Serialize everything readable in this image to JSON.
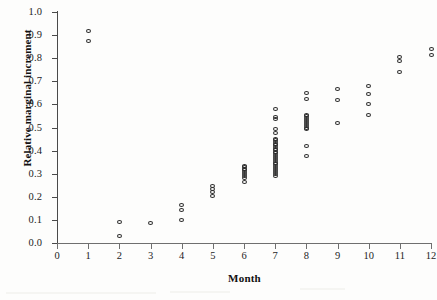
{
  "chart_data": {
    "type": "scatter",
    "title": "",
    "xlabel": "Month",
    "ylabel": "Relative marginal increment",
    "xlim": [
      0,
      12
    ],
    "ylim": [
      0.0,
      1.0
    ],
    "grid": false,
    "legend": "none",
    "marker": "open-circle",
    "xticks": [
      "0",
      "1",
      "2",
      "3",
      "4",
      "5",
      "6",
      "7",
      "8",
      "9",
      "10",
      "11",
      "12"
    ],
    "xtick_values": [
      0,
      1,
      2,
      3,
      4,
      5,
      6,
      7,
      8,
      9,
      10,
      11,
      12
    ],
    "yticks": [
      "0.0",
      "0.1",
      "0.2",
      "0.3",
      "0.4",
      "0.5",
      "0.6",
      "0.7",
      "0.8",
      "0.9",
      "1.0"
    ],
    "ytick_values": [
      0.0,
      0.1,
      0.2,
      0.3,
      0.4,
      0.5,
      0.6,
      0.7,
      0.8,
      0.9,
      1.0
    ],
    "point_color": "#2a2a2a",
    "axis_color": "#4a4a4a",
    "background": "#fdfdfc",
    "series": [
      {
        "name": "Relative marginal increment by month",
        "points": [
          {
            "x": 1,
            "y": 0.918
          },
          {
            "x": 1,
            "y": 0.873
          },
          {
            "x": 2,
            "y": 0.09
          },
          {
            "x": 2,
            "y": 0.032
          },
          {
            "x": 3,
            "y": 0.088
          },
          {
            "x": 4,
            "y": 0.163
          },
          {
            "x": 4,
            "y": 0.143
          },
          {
            "x": 4,
            "y": 0.101
          },
          {
            "x": 5,
            "y": 0.245
          },
          {
            "x": 5,
            "y": 0.233
          },
          {
            "x": 5,
            "y": 0.221
          },
          {
            "x": 5,
            "y": 0.203
          },
          {
            "x": 6,
            "y": 0.335
          },
          {
            "x": 6,
            "y": 0.328
          },
          {
            "x": 6,
            "y": 0.322
          },
          {
            "x": 6,
            "y": 0.315
          },
          {
            "x": 6,
            "y": 0.308
          },
          {
            "x": 6,
            "y": 0.3
          },
          {
            "x": 6,
            "y": 0.29
          },
          {
            "x": 6,
            "y": 0.28
          },
          {
            "x": 6,
            "y": 0.262
          },
          {
            "x": 7,
            "y": 0.58
          },
          {
            "x": 7,
            "y": 0.546
          },
          {
            "x": 7,
            "y": 0.538
          },
          {
            "x": 7,
            "y": 0.492
          },
          {
            "x": 7,
            "y": 0.476
          },
          {
            "x": 7,
            "y": 0.452
          },
          {
            "x": 7,
            "y": 0.445
          },
          {
            "x": 7,
            "y": 0.438
          },
          {
            "x": 7,
            "y": 0.43
          },
          {
            "x": 7,
            "y": 0.423
          },
          {
            "x": 7,
            "y": 0.416
          },
          {
            "x": 7,
            "y": 0.409
          },
          {
            "x": 7,
            "y": 0.402
          },
          {
            "x": 7,
            "y": 0.395
          },
          {
            "x": 7,
            "y": 0.388
          },
          {
            "x": 7,
            "y": 0.38
          },
          {
            "x": 7,
            "y": 0.372
          },
          {
            "x": 7,
            "y": 0.364
          },
          {
            "x": 7,
            "y": 0.356
          },
          {
            "x": 7,
            "y": 0.348
          },
          {
            "x": 7,
            "y": 0.34
          },
          {
            "x": 7,
            "y": 0.332
          },
          {
            "x": 7,
            "y": 0.324
          },
          {
            "x": 7,
            "y": 0.316
          },
          {
            "x": 7,
            "y": 0.308
          },
          {
            "x": 7,
            "y": 0.299
          },
          {
            "x": 7,
            "y": 0.288
          },
          {
            "x": 8,
            "y": 0.65
          },
          {
            "x": 8,
            "y": 0.625
          },
          {
            "x": 8,
            "y": 0.556
          },
          {
            "x": 8,
            "y": 0.548
          },
          {
            "x": 8,
            "y": 0.54
          },
          {
            "x": 8,
            "y": 0.532
          },
          {
            "x": 8,
            "y": 0.524
          },
          {
            "x": 8,
            "y": 0.516
          },
          {
            "x": 8,
            "y": 0.508
          },
          {
            "x": 8,
            "y": 0.5
          },
          {
            "x": 8,
            "y": 0.492
          },
          {
            "x": 8,
            "y": 0.42
          },
          {
            "x": 8,
            "y": 0.376
          },
          {
            "x": 9,
            "y": 0.665
          },
          {
            "x": 9,
            "y": 0.62
          },
          {
            "x": 9,
            "y": 0.52
          },
          {
            "x": 10,
            "y": 0.681
          },
          {
            "x": 10,
            "y": 0.645
          },
          {
            "x": 10,
            "y": 0.601
          },
          {
            "x": 10,
            "y": 0.554
          },
          {
            "x": 11,
            "y": 0.806
          },
          {
            "x": 11,
            "y": 0.79
          },
          {
            "x": 11,
            "y": 0.74
          },
          {
            "x": 12,
            "y": 0.84
          },
          {
            "x": 12,
            "y": 0.814
          }
        ]
      }
    ]
  }
}
